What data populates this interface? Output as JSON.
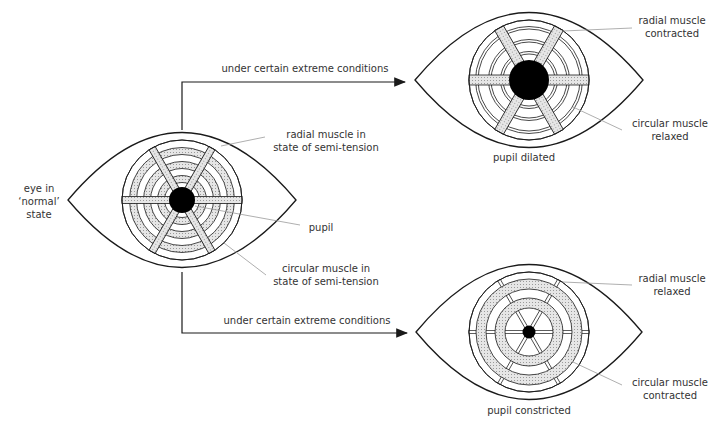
{
  "diagram": {
    "colors": {
      "ink": "#1a1a1a",
      "muscle_fill": "#d9d9d9",
      "leader": "#9a9a9a",
      "pupil": "#000000"
    },
    "normal_eye": {
      "label_line1": "eye in",
      "label_line2": "‘normal’",
      "label_line3": "state",
      "radial_label_line1": "radial muscle in",
      "radial_label_line2": "state of semi-tension",
      "pupil_label": "pupil",
      "circular_label_line1": "circular muscle in",
      "circular_label_line2": "state of semi-tension"
    },
    "arrows": {
      "upper_label": "under certain extreme conditions",
      "lower_label": "under certain extreme conditions"
    },
    "dilated_eye": {
      "radial_label_line1": "radial muscle",
      "radial_label_line2": "contracted",
      "circular_label_line1": "circular muscle",
      "circular_label_line2": "relaxed",
      "caption": "pupil dilated"
    },
    "constricted_eye": {
      "radial_label_line1": "radial muscle",
      "radial_label_line2": "relaxed",
      "circular_label_line1": "circular muscle",
      "circular_label_line2": "contracted",
      "caption": "pupil constricted"
    }
  }
}
